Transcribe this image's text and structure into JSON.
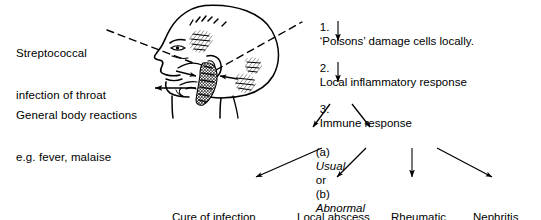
{
  "diagram": {
    "left_labels": [
      {
        "id": "streptococcal-infection",
        "line1": "Streptococcal",
        "line2": "infection of throat"
      },
      {
        "id": "general-body-reactions",
        "line1": "General body reactions",
        "line2": "e.g. fever, malaise"
      }
    ],
    "illustration": {
      "name": "head-profile-illustration",
      "description": "Line drawing of a human head in left profile with shaded throat region"
    },
    "sequence": [
      {
        "number": "1.",
        "text": "‘Poisons’ damage cells locally."
      },
      {
        "number": "2.",
        "text": "Local inflammatory response"
      },
      {
        "number": "3.",
        "text": "Immune response"
      }
    ],
    "branch": {
      "a_marker": "(a)",
      "a_text": "Usual",
      "conjunction": "or",
      "b_marker": "(b)",
      "b_text": "Abnormal"
    },
    "outcomes": [
      {
        "id": "cure-of-infection",
        "line1": "Cure of infection",
        "line2": ""
      },
      {
        "id": "local-abscess-formation",
        "line1": "Local abscess",
        "line2": "formation"
      },
      {
        "id": "rheumatic-fever",
        "line1": "Rheumatic",
        "line2": "fever"
      },
      {
        "id": "nephritis",
        "line1": "Nephritis",
        "line2": ""
      }
    ],
    "colors": {
      "ink": "#000000",
      "background": "#ffffff",
      "shading": "#1a1a1a"
    }
  }
}
